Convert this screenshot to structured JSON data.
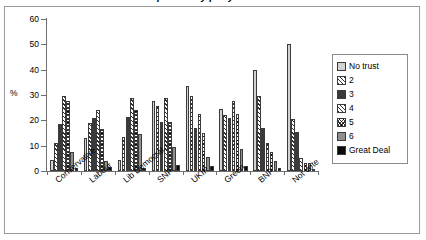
{
  "chart_data": {
    "type": "bar",
    "title": "Trust in politics by party",
    "xlabel": "",
    "ylabel": "%",
    "ylim": [
      0,
      60
    ],
    "yticks": [
      0,
      10,
      20,
      30,
      40,
      50,
      60
    ],
    "grid": false,
    "legend_position": "right",
    "categories": [
      "Conservative",
      "Labour",
      "Lib Democrat",
      "SNP",
      "UKIP",
      "Green",
      "BNP",
      "Not vote"
    ],
    "series": [
      {
        "name": "No trust",
        "values": [
          4.5,
          13.0,
          4.5,
          27.5,
          33.5,
          24.5,
          40.0,
          50.0
        ]
      },
      {
        "name": "2",
        "values": [
          11.0,
          19.0,
          13.5,
          25.5,
          29.5,
          22.0,
          29.5,
          20.5
        ]
      },
      {
        "name": "3",
        "values": [
          18.5,
          21.0,
          21.5,
          19.5,
          17.0,
          21.0,
          17.0,
          15.5
        ]
      },
      {
        "name": "4",
        "values": [
          29.5,
          24.0,
          29.0,
          29.0,
          22.5,
          27.5,
          11.0,
          5.0
        ]
      },
      {
        "name": "5",
        "values": [
          27.5,
          16.5,
          24.0,
          19.5,
          15.0,
          22.5,
          7.5,
          3.0
        ]
      },
      {
        "name": "6",
        "values": [
          7.5,
          4.0,
          14.5,
          9.5,
          5.5,
          8.5,
          4.0,
          3.0
        ]
      },
      {
        "name": "Great Deal",
        "values": [
          1.0,
          1.5,
          1.0,
          2.5,
          2.0,
          2.0,
          1.0,
          0.5
        ]
      }
    ],
    "legend_entries": [
      "No trust",
      "2",
      "3",
      "4",
      "5",
      "6",
      "Great Deal"
    ]
  }
}
